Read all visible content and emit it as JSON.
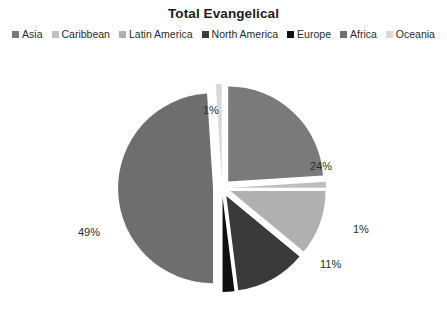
{
  "chart": {
    "title": "Total Evangelical",
    "background_color": "#ffffff",
    "text_color": "#2b2b2b",
    "title_color": "#1c1c1c"
  },
  "legend": {
    "position": "top",
    "items": [
      {
        "label": "Asia",
        "color": "#7a7a7a"
      },
      {
        "label": "Caribbean",
        "color": "#bfbfbf"
      },
      {
        "label": "Latin America",
        "color": "#b0b0b0"
      },
      {
        "label": "North America",
        "color": "#3a3a3a"
      },
      {
        "label": "Europe",
        "color": "#111111"
      },
      {
        "label": "Africa",
        "color": "#6e6e6e"
      },
      {
        "label": "Oceania",
        "color": "#d9d9d9"
      }
    ]
  },
  "labels": {
    "asia": "24%",
    "caribbean": "1%",
    "latin_america": "11%",
    "north_america": "12%",
    "europe": "2%",
    "africa": "49%",
    "oceania": "1%"
  },
  "chart_data": {
    "type": "pie",
    "title": "Total Evangelical",
    "xlabel": "",
    "ylabel": "",
    "exploded": true,
    "start_angle_deg": 0,
    "direction": "clockwise",
    "units": "percent",
    "total": 100,
    "categories": [
      "Asia",
      "Caribbean",
      "Latin America",
      "North America",
      "Europe",
      "Africa",
      "Oceania"
    ],
    "values": [
      24,
      1,
      11,
      12,
      2,
      49,
      1
    ],
    "data_labels": [
      "24%",
      "1%",
      "11%",
      "12%",
      "2%",
      "49%",
      "1%"
    ],
    "colors": [
      "#7a7a7a",
      "#bfbfbf",
      "#b0b0b0",
      "#3a3a3a",
      "#111111",
      "#6e6e6e",
      "#d9d9d9"
    ],
    "legend": [
      "Asia",
      "Caribbean",
      "Latin America",
      "North America",
      "Europe",
      "Africa",
      "Oceania"
    ],
    "grid": false,
    "legend_position": "top"
  }
}
